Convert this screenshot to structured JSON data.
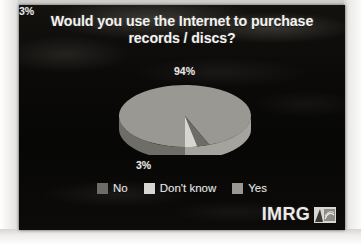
{
  "slide": {
    "title": "Would you use the Internet to purchase records / discs?",
    "title_line1": "Would you use the Internet to purchase",
    "title_line2": "records / discs?",
    "background_color": "#0a0908"
  },
  "chart_data": {
    "type": "pie",
    "title": "Would you use the Internet to purchase records / discs?",
    "three_d": true,
    "categories": [
      "Yes",
      "No",
      "Don't know"
    ],
    "values": [
      94,
      3,
      3
    ],
    "labels": [
      "94%",
      "3%",
      "3%"
    ],
    "value_suffix": "%",
    "legend_position": "bottom",
    "legend_order": [
      "No",
      "Don't know",
      "Yes"
    ],
    "colors": {
      "Yes": "#9a9892",
      "No": "#6e6c68",
      "Don't know": "#d8d6d0"
    },
    "side_colors": {
      "Yes": "#6f6d68",
      "No": "#4c4a47",
      "Don't know": "#a5a39e"
    }
  },
  "labels": {
    "yes_pct": "94%",
    "no_pct": "3%",
    "dont_know_pct": "3%"
  },
  "legend": {
    "items": [
      {
        "label": "No",
        "color": "#6e6c68"
      },
      {
        "label": "Don't know",
        "color": "#d8d6d0"
      },
      {
        "label": "Yes",
        "color": "#9a9892"
      }
    ]
  },
  "branding": {
    "name": "IMRG",
    "mark": "imrg-emblem-icon"
  }
}
